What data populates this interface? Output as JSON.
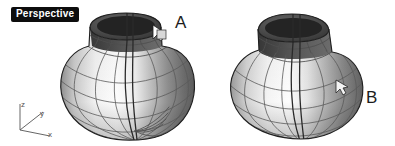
{
  "viewport": {
    "label": "Perspective",
    "background_color": "#ffffff",
    "label_bg_color": "#0d0d0d",
    "label_text_color": "#ffffff",
    "width": 395,
    "height": 146,
    "display_mode": "Shaded"
  },
  "axis_gizmo": {
    "name": "world-axes-icon",
    "origin": {
      "x": 20,
      "y": 130
    },
    "color": "#555555",
    "axes": [
      {
        "name": "z",
        "label": "z",
        "end_x": 20,
        "end_y": 104
      },
      {
        "name": "y",
        "label": "y",
        "end_x": 43,
        "end_y": 112
      },
      {
        "name": "x",
        "label": "x",
        "end_x": 50,
        "end_y": 136
      }
    ]
  },
  "objects": [
    {
      "id": "surface-a",
      "letter": "A",
      "description": "Shaded NURBS surface of revolution, vase form with narrow open neck",
      "letter_pos": {
        "x": 175,
        "y": 14
      },
      "bounds": {
        "x": 57,
        "y": 12,
        "width": 138,
        "height": 128
      },
      "cursor": {
        "name": "arrow-cursor",
        "x": 156,
        "y": 28
      }
    },
    {
      "id": "surface-b",
      "letter": "B",
      "description": "Shaded NURBS surface of revolution, vase form with wide flared neck",
      "letter_pos": {
        "x": 366,
        "y": 89
      },
      "bounds": {
        "x": 222,
        "y": 14,
        "width": 140,
        "height": 126
      },
      "cursor": {
        "name": "arrow-cursor",
        "x": 338,
        "y": 84
      }
    }
  ],
  "colors": {
    "surface_highlight": "#fcfcfc",
    "surface_light": "#e8e8e8",
    "surface_mid": "#bdbdbd",
    "surface_shade": "#8e8e8e",
    "surface_dark": "#5e5e5e",
    "interior_dark": "#3b3b3b",
    "isocurve": "#4a4a4a",
    "edge": "#262626",
    "text": "#1c1c1c"
  }
}
